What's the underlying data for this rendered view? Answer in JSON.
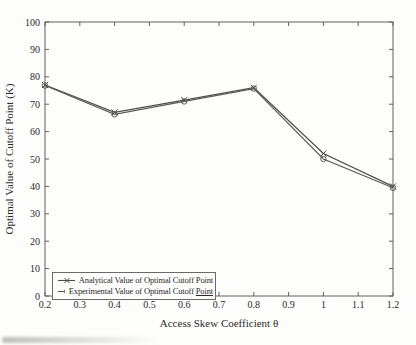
{
  "figure": {
    "bg_color": "#fdfdfb",
    "axis_color": "#606060",
    "line_color": "#4d4d4d",
    "line_color_secondary": "#5a5a5a",
    "text_color": "#2b2b2b"
  },
  "chart_data": {
    "type": "line",
    "title": "",
    "xlabel": "Access Skew Coefficient θ",
    "ylabel": "Optimal Value of Cutoff Point (K)",
    "xlim": [
      0.2,
      1.2
    ],
    "ylim": [
      0,
      100
    ],
    "grid": false,
    "legend_position": "bottom-left",
    "x_ticks": [
      0.2,
      0.3,
      0.4,
      0.5,
      0.6,
      0.7,
      0.8,
      0.9,
      1,
      1.1,
      1.2
    ],
    "x_tick_labels": [
      "0.2",
      "0.3",
      "0.4",
      "0.5",
      "0.6",
      "0.7",
      "0.8",
      "0.9",
      "1",
      "1.1",
      "1.2"
    ],
    "y_ticks": [
      0,
      10,
      20,
      30,
      40,
      50,
      60,
      70,
      80,
      90,
      100
    ],
    "y_tick_labels": [
      "0",
      "10",
      "20",
      "30",
      "40",
      "50",
      "60",
      "70",
      "80",
      "90",
      "100"
    ],
    "x": [
      0.2,
      0.4,
      0.6,
      0.8,
      1.0,
      1.2
    ],
    "series": [
      {
        "name": "Analytical Value of Optimal Cutoff Point",
        "marker": "x",
        "values": [
          77,
          67,
          71.5,
          76,
          52,
          40
        ]
      },
      {
        "name": "Experimental Value of Optimal Cutoff Point",
        "marker": "o",
        "values": [
          76.8,
          66.3,
          71,
          75.7,
          50,
          39.5
        ]
      }
    ]
  },
  "legend": {
    "items": [
      {
        "marker": "x-marker",
        "label": "Analytical Value of Optimal Cutoff Point",
        "underlined_part": ""
      },
      {
        "marker": "o-marker",
        "label": "Experimental Value of Optimal Cutoff ",
        "underlined_part": "Point"
      }
    ]
  }
}
